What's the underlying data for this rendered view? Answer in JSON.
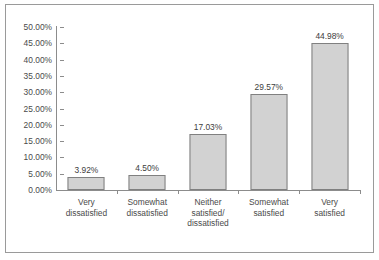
{
  "chart_data": {
    "type": "bar",
    "title": "",
    "subtitle": "",
    "xlabel": "",
    "ylabel": "",
    "ylim": [
      0,
      50
    ],
    "grid": false,
    "legend": false,
    "categories": [
      "Very\ndissatisfied",
      "Somewhat\ndissatisfied",
      "Neither\nsatisfied/\ndissatisfied",
      "Somewhat\nsatisfied",
      "Very\nsatisfied"
    ],
    "values": [
      3.92,
      4.5,
      17.03,
      29.57,
      44.98
    ],
    "value_labels": [
      "3.92%",
      "4.50%",
      "17.03%",
      "29.57%",
      "44.98%"
    ],
    "y_ticks": [
      0,
      5,
      10,
      15,
      20,
      25,
      30,
      35,
      40,
      45,
      50
    ],
    "y_tick_labels": [
      "0.00%",
      "5.00%",
      "10.00%",
      "15.00%",
      "20.00%",
      "25.00%",
      "30.00%",
      "35.00%",
      "40.00%",
      "45.00%",
      "50.00%"
    ]
  },
  "style": {
    "bar_fill": "#d2d2d2",
    "bar_stroke": "#808080",
    "axis_color": "#8c8c8c",
    "text_color": "#4a4a4a",
    "frame_color": "#9a9a9a",
    "background": "#ffffff"
  }
}
